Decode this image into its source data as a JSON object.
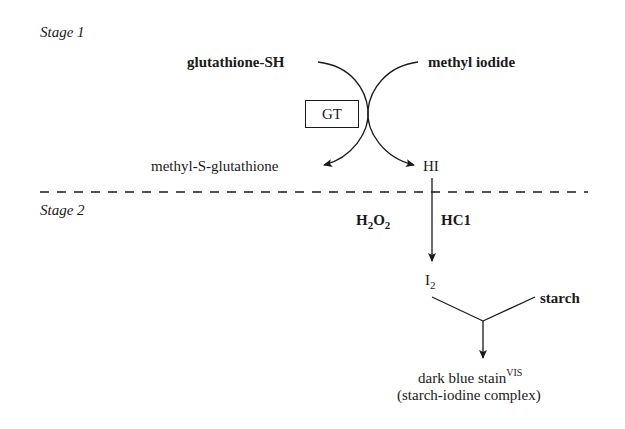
{
  "stage1": {
    "label": "Stage 1",
    "reactant_left": "glutathione-SH",
    "reactant_right": "methyl iodide",
    "enzyme": "GT",
    "product_left": "methyl-S-glutathione",
    "product_right": "HI"
  },
  "stage2": {
    "label": "Stage 2",
    "reagent_left": {
      "main": "H",
      "sub1": "2",
      "mid": "O",
      "sub2": "2"
    },
    "reagent_right": "HC1",
    "intermediate": {
      "main": "I",
      "sub": "2"
    },
    "cosubstrate": "starch",
    "product": {
      "main": "dark blue stain",
      "sup": "VIS"
    },
    "product_note": "(starch-iodine complex)"
  },
  "colors": {
    "ink": "#1a1a1a",
    "background": "#ffffff"
  }
}
